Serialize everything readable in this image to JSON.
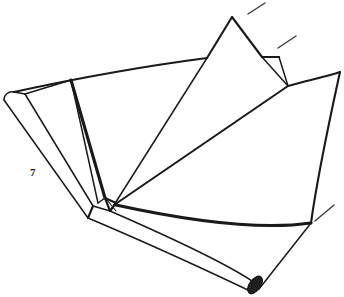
{
  "figure": {
    "kind": "line-drawing",
    "medium": "pen-and-ink technical illustration",
    "background_color": "#ffffff",
    "ink_color": "#1a1a1a",
    "canvas": {
      "width": 344,
      "height": 297
    }
  },
  "labels": [
    {
      "id": "label-7",
      "text": "7",
      "x": 30,
      "y": 176,
      "color": "#242424"
    }
  ],
  "leader_lines": [
    {
      "id": "leader-top",
      "x1": 248,
      "y1": 14,
      "x2": 265,
      "y2": 3
    },
    {
      "id": "leader-notch",
      "x1": 278,
      "y1": 48,
      "x2": 296,
      "y2": 36
    },
    {
      "id": "leader-bottom-right",
      "x1": 315,
      "y1": 221,
      "x2": 334,
      "y2": 205
    }
  ],
  "strokes": {
    "top_curved_edge": "Long shallow curve sweeping from the left strip corner up to the peak shoulder",
    "peak_panel": "Tall triangular peak rising at top centre-right",
    "notch": "Small narrow wedge notch to the right of the peak",
    "right_concave_edge": "Concave curved right-hand border falling to the lower right corner",
    "radiating_creases": "Several straight creases converging on the central vertex",
    "left_strip": "Narrow folded strip running down the left side",
    "lower_tube": "Rolled tubular edge running from the centre vertex to the lower right, capped by a dark ellipse",
    "central_vertex": "Small triangular facet where all creases meet"
  },
  "palette": {
    "ink": "#1a1a1a",
    "ink_soft": "#3b3b3b",
    "cap_fill": "#1f1f1f",
    "paper": "#ffffff"
  }
}
